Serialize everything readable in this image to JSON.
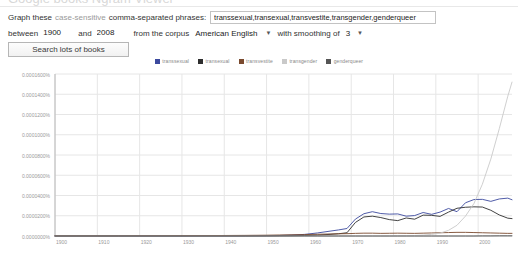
{
  "header": {
    "ghost_title": "Google books Ngram Viewer"
  },
  "form": {
    "label_graph_these": "Graph these",
    "label_case_sensitive": "case-sensitive",
    "label_comma_separated": "comma-separated phrases:",
    "query_value": "transsexual,transexual,transvestite,transgender,genderqueer",
    "query_placeholder": "",
    "label_between": "between",
    "year_start": "1900",
    "label_and": "and",
    "year_end": "2008",
    "label_from_corpus": "from the corpus",
    "corpus_value": "American English",
    "corpus_caret_icon": "chevron-down-icon",
    "label_with_smoothing": "with smoothing of",
    "smoothing_value": "3",
    "smoothing_caret_icon": "chevron-down-icon",
    "search_button": "Search lots of books"
  },
  "colors": {
    "series_1": "#3c4a9e",
    "series_2": "#2e2e2e",
    "series_3": "#7a4a2e",
    "series_4": "#c9c9c9",
    "series_5": "#555555",
    "grid": "#e6e6e6",
    "axis": "#b8b8b8",
    "tick_text": "#9a9a9a"
  },
  "chart_data": {
    "type": "line",
    "title": "",
    "xlabel": "",
    "ylabel": "",
    "grid": true,
    "legend_position": "top",
    "xlim": [
      1900,
      2008
    ],
    "ylim": [
      0.0,
      0.00016
    ],
    "xticks": [
      "1900",
      "1910",
      "1920",
      "1930",
      "1940",
      "1950",
      "1960",
      "1970",
      "1980",
      "1990",
      "2000"
    ],
    "yticks": [
      "0.0001600%",
      "0.0001400%",
      "0.0001200%",
      "0.0001000%",
      "0.0000800%",
      "0.0000600%",
      "0.0000400%",
      "0.0000200%",
      "0.0000000%"
    ],
    "x": [
      1900,
      1905,
      1910,
      1915,
      1920,
      1925,
      1930,
      1935,
      1940,
      1945,
      1950,
      1953,
      1956,
      1959,
      1962,
      1965,
      1967,
      1969,
      1971,
      1973,
      1975,
      1977,
      1979,
      1981,
      1983,
      1985,
      1987,
      1989,
      1991,
      1993,
      1995,
      1997,
      1999,
      2001,
      2003,
      2005,
      2007,
      2008
    ],
    "series": [
      {
        "name": "transsexual",
        "color": "#3c4a9e",
        "values": [
          0.0,
          0.0,
          0.0,
          0.0,
          0.0,
          0.0,
          0.0,
          1e-07,
          1e-07,
          2e-07,
          3e-07,
          5e-07,
          9e-07,
          1.6e-06,
          3e-06,
          4.8e-06,
          6e-06,
          7.4e-06,
          1.67e-05,
          2.2e-05,
          2.4e-05,
          2.22e-05,
          2.16e-05,
          2.18e-05,
          1.96e-05,
          2.02e-05,
          2.32e-05,
          2.14e-05,
          2.36e-05,
          2.72e-05,
          2.4e-05,
          3.28e-05,
          3.6e-05,
          3.62e-05,
          3.42e-05,
          3.66e-05,
          3.74e-05,
          3.58e-05
        ]
      },
      {
        "name": "transexual",
        "color": "#2e2e2e",
        "values": [
          0.0,
          0.0,
          0.0,
          0.0,
          0.0,
          0.0,
          0.0,
          0.0,
          0.0,
          0.0,
          1e-07,
          2e-07,
          3e-07,
          5e-07,
          9e-07,
          1.6e-06,
          2.2e-06,
          3.2e-06,
          1.34e-05,
          1.88e-05,
          1.96e-05,
          1.82e-05,
          1.62e-05,
          1.52e-05,
          1.78e-05,
          1.66e-05,
          2.06e-05,
          2.04e-05,
          1.94e-05,
          2.36e-05,
          2.74e-05,
          2.84e-05,
          2.88e-05,
          2.86e-05,
          2.54e-05,
          2.08e-05,
          1.76e-05,
          1.72e-05
        ]
      },
      {
        "name": "transvestite",
        "color": "#7a4a2e",
        "values": [
          2e-07,
          2e-07,
          2e-07,
          2e-07,
          3e-07,
          3e-07,
          4e-07,
          4e-07,
          5e-07,
          6e-07,
          8e-07,
          1e-06,
          1.2e-06,
          1.4e-06,
          1.7e-06,
          2e-06,
          2.2e-06,
          2.3e-06,
          2.6e-06,
          2.8e-06,
          2.8e-06,
          2.6e-06,
          2.7e-06,
          2.8e-06,
          2.7e-06,
          2.6e-06,
          2.8e-06,
          3e-06,
          3.2e-06,
          3.4e-06,
          3.6e-06,
          3.6e-06,
          3.4e-06,
          3.2e-06,
          3e-06,
          2.8e-06,
          2.6e-06,
          2.6e-06
        ]
      },
      {
        "name": "transgender",
        "color": "#c9c9c9",
        "values": [
          0.0,
          0.0,
          0.0,
          0.0,
          0.0,
          0.0,
          0.0,
          0.0,
          0.0,
          0.0,
          0.0,
          0.0,
          0.0,
          0.0,
          0.0,
          0.0,
          0.0,
          0.0,
          0.0,
          0.0,
          0.0,
          0.0,
          1e-07,
          2e-07,
          3e-07,
          5e-07,
          9e-07,
          1.6e-06,
          2.8e-06,
          5.6e-06,
          1.06e-05,
          1.96e-05,
          3.2e-05,
          5.12e-05,
          7.6e-05,
          0.000106,
          0.000138,
          0.000152
        ]
      },
      {
        "name": "genderqueer",
        "color": "#555555",
        "values": [
          0.0,
          0.0,
          0.0,
          0.0,
          0.0,
          0.0,
          0.0,
          0.0,
          0.0,
          0.0,
          0.0,
          0.0,
          0.0,
          0.0,
          0.0,
          0.0,
          0.0,
          0.0,
          0.0,
          0.0,
          0.0,
          0.0,
          0.0,
          0.0,
          0.0,
          0.0,
          0.0,
          0.0,
          0.0,
          0.0,
          0.0,
          0.0,
          0.0,
          1e-07,
          1e-07,
          2e-07,
          2e-07,
          2e-07
        ]
      }
    ]
  }
}
